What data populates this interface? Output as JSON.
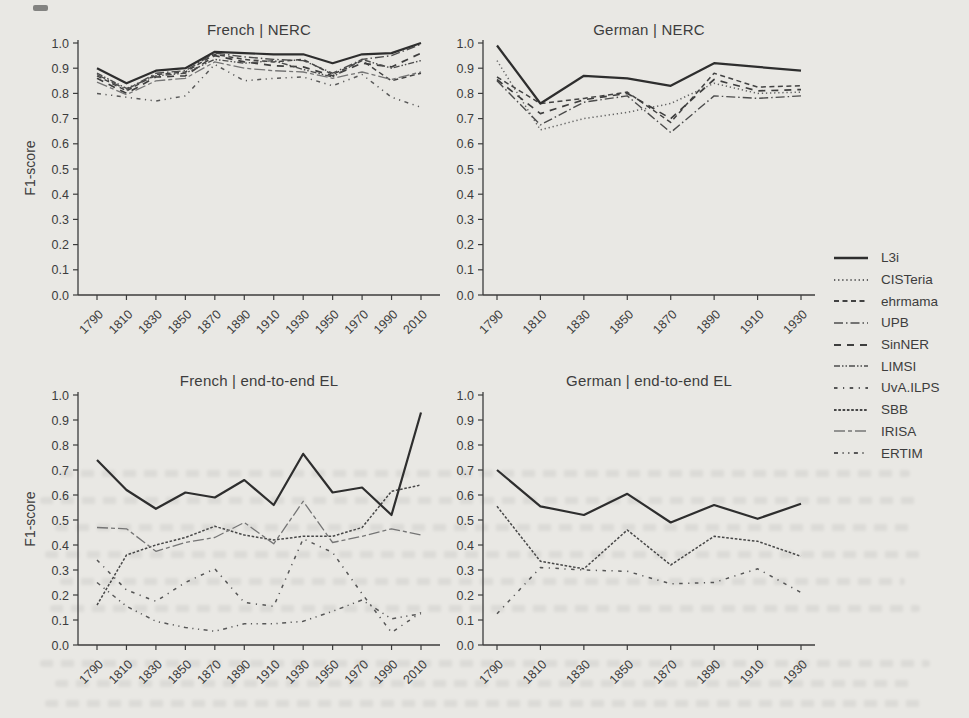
{
  "page": {
    "background": "#e9e8e4",
    "ink": "#3c3c3c"
  },
  "legend": {
    "entries": [
      "L3i",
      "CISTeria",
      "ehrmama",
      "UPB",
      "SinNER",
      "LIMSI",
      "UvA.ILPS",
      "SBB",
      "IRISA",
      "ERTIM"
    ]
  },
  "line_styles": {
    "L3i": {
      "dash": "",
      "width": 2.2,
      "color": "#2e2e2e"
    },
    "CISTeria": {
      "dash": "1.3 2.8",
      "width": 1.5,
      "color": "#636363"
    },
    "ehrmama": {
      "dash": "5 3.5",
      "width": 1.5,
      "color": "#424242"
    },
    "UPB": {
      "dash": "9 3 1.5 3",
      "width": 1.4,
      "color": "#4c4c4c"
    },
    "SinNER": {
      "dash": "7 6",
      "width": 1.7,
      "color": "#3e3e3e"
    },
    "LIMSI": {
      "dash": "6 2 1.5 2 1.5 2",
      "width": 1.4,
      "color": "#4c4c4c"
    },
    "UvA.ILPS": {
      "dash": "3.5 5.5 1.2 5.5",
      "width": 1.5,
      "color": "#555555"
    },
    "SBB": {
      "dash": "2.6 1.7",
      "width": 1.5,
      "color": "#474747"
    },
    "IRISA": {
      "dash": "11 3 4 3",
      "width": 1.3,
      "color": "#757575"
    },
    "ERTIM": {
      "dash": "4 4.5 1.2 4.5 1.2 4.5",
      "width": 1.5,
      "color": "#585858"
    }
  },
  "chart_data": [
    {
      "type": "line",
      "title": "French | NERC",
      "xlabel": "",
      "ylabel": "F1-score",
      "ylim": [
        0.0,
        1.0
      ],
      "yticks": [
        "0.0",
        "0.1",
        "0.2",
        "0.3",
        "0.4",
        "0.5",
        "0.6",
        "0.7",
        "0.8",
        "0.9",
        "1.0"
      ],
      "x": [
        "1790",
        "1810",
        "1830",
        "1850",
        "1870",
        "1890",
        "1910",
        "1930",
        "1950",
        "1970",
        "1990",
        "2010"
      ],
      "grid": false,
      "series": [
        {
          "name": "L3i",
          "values": [
            0.9,
            0.84,
            0.89,
            0.9,
            0.965,
            0.96,
            0.955,
            0.955,
            0.92,
            0.955,
            0.96,
            1.0
          ]
        },
        {
          "name": "ehrmama",
          "values": [
            0.87,
            0.81,
            0.875,
            0.885,
            0.955,
            0.935,
            0.925,
            0.935,
            0.875,
            0.93,
            0.85,
            0.88
          ]
        },
        {
          "name": "UPB",
          "values": [
            0.875,
            0.815,
            0.88,
            0.89,
            0.96,
            0.945,
            0.935,
            0.93,
            0.88,
            0.935,
            0.95,
            0.995
          ]
        },
        {
          "name": "SinNER",
          "values": [
            0.86,
            0.8,
            0.865,
            0.87,
            0.95,
            0.925,
            0.91,
            0.905,
            0.87,
            0.92,
            0.905,
            0.96
          ]
        },
        {
          "name": "LIMSI",
          "values": [
            0.88,
            0.82,
            0.87,
            0.88,
            0.935,
            0.92,
            0.93,
            0.895,
            0.865,
            0.935,
            0.9,
            0.93
          ]
        },
        {
          "name": "IRISA",
          "values": [
            0.845,
            0.795,
            0.85,
            0.86,
            0.925,
            0.9,
            0.89,
            0.885,
            0.86,
            0.885,
            0.855,
            0.885
          ]
        },
        {
          "name": "ERTIM",
          "values": [
            0.8,
            0.785,
            0.77,
            0.79,
            0.915,
            0.85,
            0.86,
            0.865,
            0.83,
            0.875,
            0.785,
            0.745
          ]
        }
      ]
    },
    {
      "type": "line",
      "title": "German | NERC",
      "xlabel": "",
      "ylabel": "",
      "ylim": [
        0.0,
        1.0
      ],
      "yticks": [
        "0.0",
        "0.1",
        "0.2",
        "0.3",
        "0.4",
        "0.5",
        "0.6",
        "0.7",
        "0.8",
        "0.9",
        "1.0"
      ],
      "x": [
        "1790",
        "1810",
        "1830",
        "1850",
        "1870",
        "1890",
        "1910",
        "1930"
      ],
      "grid": false,
      "series": [
        {
          "name": "L3i",
          "values": [
            0.99,
            0.76,
            0.87,
            0.86,
            0.83,
            0.92,
            0.905,
            0.89
          ]
        },
        {
          "name": "CISTeria",
          "values": [
            0.93,
            0.655,
            0.7,
            0.725,
            0.76,
            0.84,
            0.8,
            0.805
          ]
        },
        {
          "name": "ehrmama",
          "values": [
            0.865,
            0.76,
            0.78,
            0.805,
            0.685,
            0.88,
            0.825,
            0.83
          ]
        },
        {
          "name": "UPB",
          "values": [
            0.85,
            0.675,
            0.765,
            0.79,
            0.645,
            0.79,
            0.78,
            0.79
          ]
        },
        {
          "name": "SinNER",
          "values": [
            0.855,
            0.72,
            0.775,
            0.8,
            0.7,
            0.855,
            0.81,
            0.815
          ]
        }
      ]
    },
    {
      "type": "line",
      "title": "French | end-to-end EL",
      "xlabel": "",
      "ylabel": "F1-score",
      "ylim": [
        0.0,
        1.0
      ],
      "yticks": [
        "0.0",
        "0.1",
        "0.2",
        "0.3",
        "0.4",
        "0.5",
        "0.6",
        "0.7",
        "0.8",
        "0.9",
        "1.0"
      ],
      "x": [
        "1790",
        "1810",
        "1830",
        "1850",
        "1870",
        "1890",
        "1910",
        "1930",
        "1950",
        "1970",
        "1990",
        "2010"
      ],
      "grid": false,
      "series": [
        {
          "name": "L3i",
          "values": [
            0.74,
            0.62,
            0.545,
            0.61,
            0.59,
            0.66,
            0.56,
            0.765,
            0.61,
            0.63,
            0.52,
            0.93
          ]
        },
        {
          "name": "SBB",
          "values": [
            0.16,
            0.36,
            0.4,
            0.43,
            0.475,
            0.44,
            0.42,
            0.435,
            0.435,
            0.47,
            0.615,
            0.64
          ]
        },
        {
          "name": "IRISA",
          "values": [
            0.47,
            0.465,
            0.375,
            0.41,
            0.43,
            0.49,
            0.405,
            0.575,
            0.41,
            0.435,
            0.465,
            0.44
          ]
        },
        {
          "name": "UvA.ILPS",
          "values": [
            0.34,
            0.22,
            0.175,
            0.25,
            0.305,
            0.17,
            0.155,
            0.425,
            0.37,
            0.205,
            0.05,
            0.13
          ]
        },
        {
          "name": "ERTIM",
          "values": [
            0.25,
            0.155,
            0.095,
            0.07,
            0.055,
            0.085,
            0.085,
            0.095,
            0.135,
            0.18,
            0.105,
            0.125
          ]
        }
      ]
    },
    {
      "type": "line",
      "title": "German | end-to-end EL",
      "xlabel": "",
      "ylabel": "",
      "ylim": [
        0.0,
        1.0
      ],
      "yticks": [
        "0.0",
        "0.1",
        "0.2",
        "0.3",
        "0.4",
        "0.5",
        "0.6",
        "0.7",
        "0.8",
        "0.9",
        "1.0"
      ],
      "x": [
        "1790",
        "1810",
        "1830",
        "1850",
        "1870",
        "1890",
        "1910",
        "1930"
      ],
      "grid": false,
      "series": [
        {
          "name": "L3i",
          "values": [
            0.7,
            0.555,
            0.52,
            0.605,
            0.49,
            0.56,
            0.505,
            0.565
          ]
        },
        {
          "name": "SBB",
          "values": [
            0.555,
            0.335,
            0.305,
            0.46,
            0.32,
            0.435,
            0.415,
            0.355
          ]
        },
        {
          "name": "UvA.ILPS",
          "values": [
            0.125,
            0.31,
            0.3,
            0.295,
            0.245,
            0.25,
            0.305,
            0.21
          ]
        }
      ]
    }
  ]
}
